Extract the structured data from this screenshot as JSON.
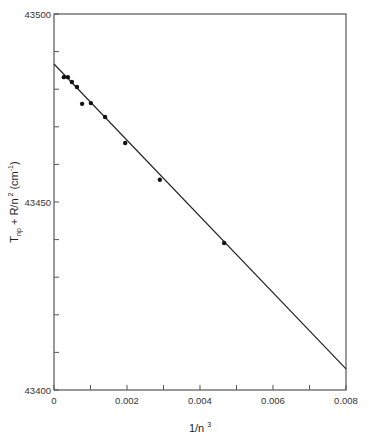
{
  "chart_data": {
    "type": "scatter",
    "title": "",
    "xlabel": "1/n³",
    "xlabel_base": "1/n",
    "xlabel_sup": "3",
    "ylabel": "T_np + R/n² (cm⁻¹)",
    "ylabel_parts": {
      "T": "T",
      "sub": "np",
      "mid": " + R/n",
      "sup2": "2",
      "unit_open": " (cm",
      "sup_unit": "-1",
      "unit_close": ")"
    },
    "xlim": [
      0,
      0.008
    ],
    "ylim": [
      43400,
      43500
    ],
    "x_ticks": [
      0,
      0.001,
      0.002,
      0.003,
      0.004,
      0.005,
      0.006,
      0.007,
      0.008
    ],
    "x_tick_labels": [
      "0",
      "",
      "0.002",
      "",
      "0.004",
      "",
      "0.006",
      "",
      "0.008"
    ],
    "y_ticks": [
      43400,
      43410,
      43420,
      43430,
      43440,
      43450,
      43460,
      43470,
      43480,
      43490,
      43500
    ],
    "y_tick_labels": [
      "43400",
      "",
      "",
      "",
      "",
      "43450",
      "",
      "",
      "",
      "",
      "43500"
    ],
    "grid": false,
    "legend": null,
    "series": [
      {
        "name": "measured",
        "marker": "filled-circle",
        "x": [
          0.00027,
          0.00038,
          0.00049,
          0.00063,
          0.00077,
          0.00101,
          0.0014,
          0.00195,
          0.0029,
          0.00466
        ],
        "y": [
          43483.2,
          43483.2,
          43481.9,
          43480.6,
          43476.1,
          43476.3,
          43472.6,
          43465.7,
          43455.9,
          43439.1
        ]
      },
      {
        "name": "linear fit",
        "style": "line",
        "x": [
          0,
          0.008
        ],
        "y": [
          43486.7,
          43405.6
        ]
      }
    ]
  }
}
